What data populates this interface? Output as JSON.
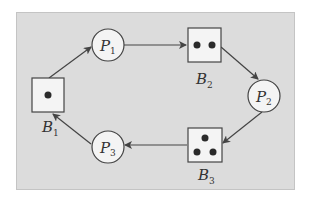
{
  "diagram": {
    "type": "petri-net-cycle",
    "colors": {
      "background": "#dcdcdc",
      "node_fill": "#f4f4f4",
      "stroke": "#444444",
      "token": "#2a2a2a"
    },
    "places": [
      {
        "id": "P1",
        "letter": "P",
        "sub": "1",
        "cx": 108,
        "cy": 45
      },
      {
        "id": "P2",
        "letter": "P",
        "sub": "2",
        "cx": 264,
        "cy": 96
      },
      {
        "id": "P3",
        "letter": "P",
        "sub": "3",
        "cx": 108,
        "cy": 147
      }
    ],
    "buffers": [
      {
        "id": "B1",
        "letter": "B",
        "sub": "1",
        "tokens": 1,
        "x": 32,
        "y": 78
      },
      {
        "id": "B2",
        "letter": "B",
        "sub": "2",
        "tokens": 2,
        "x": 188,
        "y": 28
      },
      {
        "id": "B3",
        "letter": "B",
        "sub": "3",
        "tokens": 3,
        "x": 188,
        "y": 128
      }
    ],
    "arcs": [
      {
        "from": "B1",
        "to": "P1"
      },
      {
        "from": "P1",
        "to": "B2"
      },
      {
        "from": "B2",
        "to": "P2"
      },
      {
        "from": "P2",
        "to": "B3"
      },
      {
        "from": "B3",
        "to": "P3"
      },
      {
        "from": "P3",
        "to": "B1"
      }
    ]
  }
}
